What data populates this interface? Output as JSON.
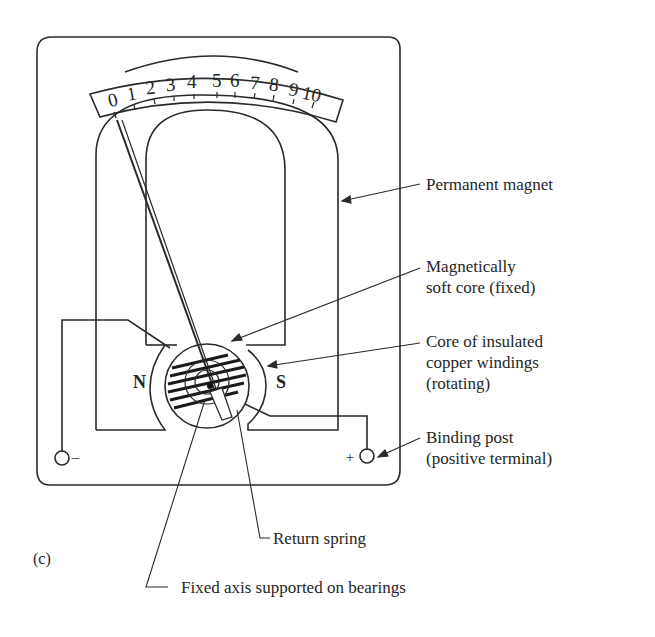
{
  "figure": {
    "label": "(c)",
    "scale": {
      "ticks": [
        "0",
        "1",
        "2",
        "3",
        "4",
        "5",
        "6",
        "7",
        "8",
        "9",
        "10"
      ]
    },
    "poles": {
      "north": "N",
      "south": "S"
    },
    "terminals": {
      "negative": "–",
      "positive": "+"
    }
  },
  "callouts": [
    {
      "id": "permanent-magnet",
      "lines": [
        "Permanent magnet"
      ]
    },
    {
      "id": "soft-core",
      "lines": [
        "Magnetically",
        "soft core (fixed)"
      ]
    },
    {
      "id": "windings",
      "lines": [
        "Core of insulated",
        "copper windings",
        "(rotating)"
      ]
    },
    {
      "id": "binding-post",
      "lines": [
        "Binding post",
        "(positive terminal)"
      ]
    },
    {
      "id": "return-spring",
      "lines": [
        "Return spring"
      ]
    },
    {
      "id": "fixed-axis",
      "lines": [
        "Fixed axis supported on bearings"
      ]
    }
  ]
}
